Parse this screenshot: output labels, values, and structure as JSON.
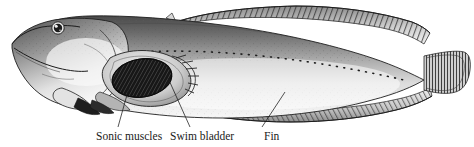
{
  "figure": {
    "background_color": "#ffffff",
    "ink_color": "#1a1a1a",
    "labels": [
      {
        "id": "sonic-muscles",
        "text": "Sonic muscles",
        "x": 96,
        "y": 131
      },
      {
        "id": "swim-bladder",
        "text": "Swim bladder",
        "x": 170,
        "y": 131
      },
      {
        "id": "fin",
        "text": "Fin",
        "x": 264,
        "y": 131
      }
    ],
    "leader_lines": [
      {
        "id": "leader-sonic-muscles",
        "from": [
          130,
          84
        ],
        "to": [
          118,
          127
        ]
      },
      {
        "id": "leader-swim-bladder",
        "from": [
          168,
          78
        ],
        "to": [
          190,
          127
        ]
      },
      {
        "id": "leader-fin",
        "from": [
          285,
          92
        ],
        "to": [
          262,
          127
        ]
      }
    ],
    "parts": [
      "head",
      "eye",
      "mouth",
      "pectoral-fin",
      "pelvic-fin",
      "dorsal-fin",
      "anal-fin",
      "caudal-fin",
      "lateral-line",
      "swim-bladder",
      "sonic-muscle-mass"
    ]
  }
}
